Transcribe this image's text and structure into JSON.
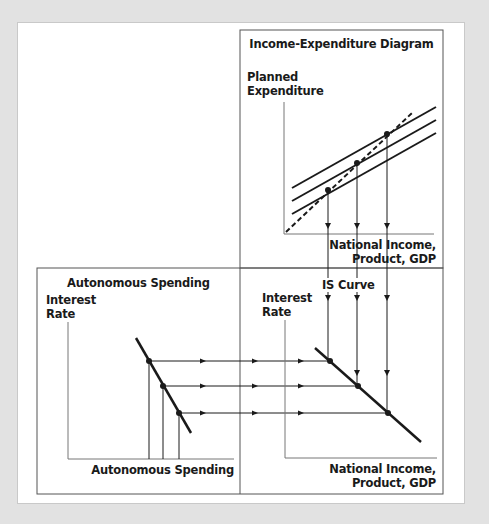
{
  "panels": {
    "income_expenditure": {
      "title": "Income-Expenditure Diagram",
      "y_label_line1": "Planned",
      "y_label_line2": "Expenditure",
      "x_label_line1": "National Income,",
      "x_label_line2": "Product, GDP"
    },
    "is_curve": {
      "title": "IS Curve",
      "y_label_line1": "Interest",
      "y_label_line2": "Rate",
      "x_label_line1": "National Income,",
      "x_label_line2": "Product, GDP"
    },
    "autonomous_spending": {
      "title": "Autonomous Spending",
      "y_label_line1": "Interest",
      "y_label_line2": "Rate",
      "x_label": "Autonomous Spending"
    }
  },
  "colors": {
    "background": "#e2e2e2",
    "panel": "#ffffff",
    "line": "#1a1a1a",
    "frame": "#555555"
  }
}
